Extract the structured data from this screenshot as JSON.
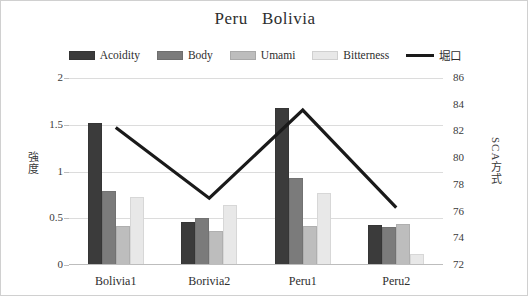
{
  "chart": {
    "title": "Peru   Bolivia",
    "legend": [
      {
        "label": "Acoidity",
        "color": "#3b3b3b",
        "type": "bar"
      },
      {
        "label": "Body",
        "color": "#7b7b7b",
        "type": "bar"
      },
      {
        "label": "Umami",
        "color": "#bdbdbd",
        "type": "bar"
      },
      {
        "label": "Bitterness",
        "color": "#e8e8e8",
        "type": "bar"
      },
      {
        "label": "堀口",
        "color": "#1a1a1a",
        "type": "line"
      }
    ],
    "y_left_label": "強度",
    "y_right_label": "SCA方式",
    "y_left_ticks": [
      "0",
      "0.5",
      "1",
      "1.5",
      "2"
    ],
    "y_right_ticks": [
      "72",
      "74",
      "76",
      "78",
      "80",
      "82",
      "84",
      "86"
    ]
  },
  "chart_data": {
    "type": "bar",
    "title": "Peru   Bolivia",
    "xlabel": "",
    "ylabel": "強度",
    "y2label": "SCA方式",
    "categories": [
      "Bolivia1",
      "Borivia2",
      "Peru1",
      "Peru2"
    ],
    "ylim": [
      0,
      2
    ],
    "y2lim": [
      72,
      86
    ],
    "ytick_step": 0.5,
    "y2tick_step": 2,
    "grid": true,
    "legend_position": "top",
    "series": [
      {
        "name": "Acoidity",
        "type": "bar",
        "axis": "left",
        "color": "#3b3b3b",
        "values": [
          1.51,
          0.45,
          1.67,
          0.42
        ]
      },
      {
        "name": "Body",
        "type": "bar",
        "axis": "left",
        "color": "#7b7b7b",
        "values": [
          0.78,
          0.49,
          0.92,
          0.4
        ]
      },
      {
        "name": "Umami",
        "type": "bar",
        "axis": "left",
        "color": "#bdbdbd",
        "values": [
          0.41,
          0.35,
          0.41,
          0.43
        ]
      },
      {
        "name": "Bitterness",
        "type": "bar",
        "axis": "left",
        "color": "#e8e8e8",
        "values": [
          0.72,
          0.63,
          0.76,
          0.11
        ]
      },
      {
        "name": "堀口",
        "type": "line",
        "axis": "right",
        "color": "#1a1a1a",
        "values": [
          82.3,
          77.0,
          83.6,
          76.3
        ]
      }
    ]
  }
}
